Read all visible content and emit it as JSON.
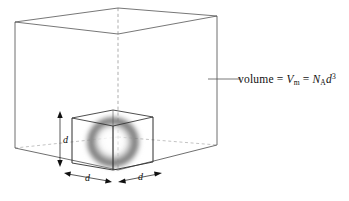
{
  "figure": {
    "type": "perspective-diagram",
    "outer_cube": {
      "name": "molar-volume-cube",
      "style": "wireframe-perspective",
      "line_color": "#4a4a4a",
      "hidden_edge_style": "dashed"
    },
    "inner_cube": {
      "name": "atom-cell-cube",
      "edge_length_label": "d",
      "line_color": "#333333"
    },
    "atom": {
      "name": "atom-sphere",
      "style": "fuzzy-shell-gradient",
      "core_color": "#f2f2f2",
      "shell_color": "#5d5d5d"
    }
  },
  "annotations": {
    "callout": {
      "prefix": "volume",
      "equals_1": "=",
      "symbol_v": "V",
      "symbol_v_sub": "m",
      "equals_2": "=",
      "symbol_n": "N",
      "symbol_n_sub": "A",
      "symbol_d": "d",
      "symbol_d_sup": "3",
      "plain_text": "volume = Vm = NAd3"
    },
    "dimensions": [
      {
        "id": "height",
        "label": "d",
        "orientation": "vertical"
      },
      {
        "id": "width-left",
        "label": "d",
        "orientation": "left-oblique"
      },
      {
        "id": "width-right",
        "label": "d",
        "orientation": "right-oblique"
      }
    ]
  },
  "colors": {
    "background": "#ffffff",
    "outline": "#4a4a4a",
    "inner_outline": "#2f2f2f",
    "text": "#111111",
    "leader": "#555555"
  }
}
